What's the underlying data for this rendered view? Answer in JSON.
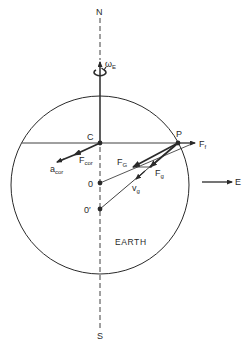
{
  "figure": {
    "colors": {
      "ink": "#2a2a2a",
      "background": "#ffffff"
    }
  },
  "axis": {
    "north_label": "N",
    "south_label": "S",
    "rotation_label_main": "ω",
    "rotation_label_sub": "E"
  },
  "points": {
    "c_label": "C",
    "p_label": "P",
    "o_label": "0",
    "o_prime_label": "0′"
  },
  "vectors": {
    "f_f": {
      "main": "F",
      "sub": "f"
    },
    "f_cor": {
      "main": "F",
      "sub": "cor"
    },
    "a_cor": {
      "main": "a",
      "sub": "cor"
    },
    "f_G": {
      "main": "F",
      "sub": "G"
    },
    "f_g": {
      "main": "F",
      "sub": "g"
    },
    "v_g": {
      "main": "v",
      "sub": "g"
    }
  },
  "body": {
    "earth_label": "EARTH"
  },
  "direction": {
    "east_label": "E"
  }
}
